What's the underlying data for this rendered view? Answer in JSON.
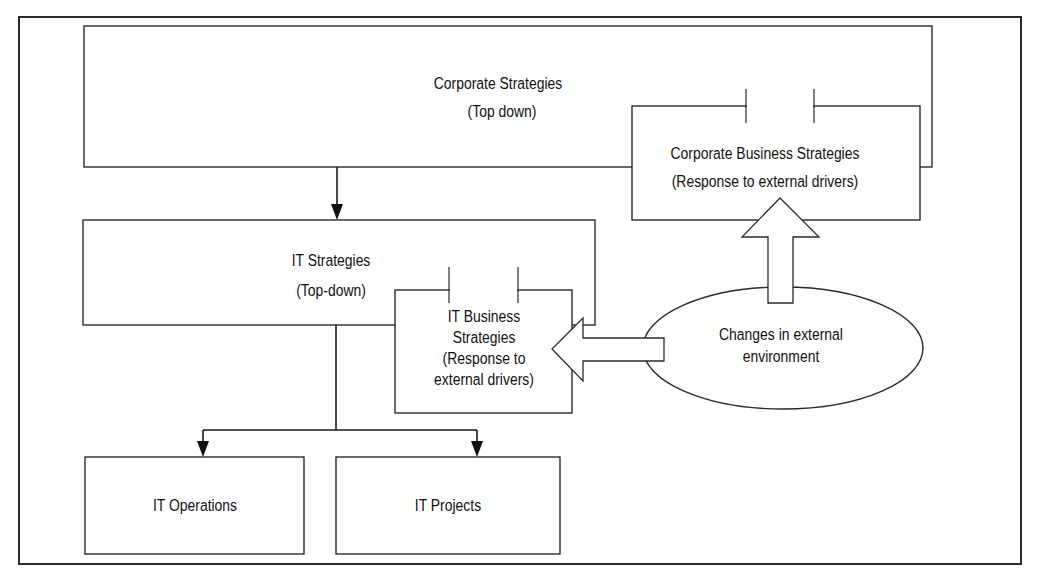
{
  "diagram": {
    "nodes": {
      "corporate_strategies": {
        "lines": [
          "Corporate Strategies",
          "(Top down)"
        ]
      },
      "corporate_business_strategies": {
        "lines": [
          "Corporate Business Strategies",
          "(Response to external drivers)"
        ]
      },
      "it_strategies": {
        "lines": [
          "IT Strategies",
          "(Top-down)"
        ]
      },
      "it_business_strategies": {
        "lines": [
          "IT Business",
          "Strategies",
          "(Response to",
          "external drivers)"
        ]
      },
      "external_environment": {
        "lines": [
          "Changes in external",
          "environment"
        ]
      },
      "it_operations": {
        "lines": [
          "IT Operations"
        ]
      },
      "it_projects": {
        "lines": [
          "IT Projects"
        ]
      }
    },
    "edges": [
      {
        "from": "corporate_strategies",
        "to": "it_strategies",
        "style": "solid-arrow"
      },
      {
        "from": "it_strategies",
        "to": "it_operations",
        "style": "solid-arrow"
      },
      {
        "from": "it_strategies",
        "to": "it_projects",
        "style": "solid-arrow"
      },
      {
        "from": "external_environment",
        "to": "corporate_business_strategies",
        "style": "block-arrow"
      },
      {
        "from": "external_environment",
        "to": "it_business_strategies",
        "style": "block-arrow"
      }
    ]
  }
}
